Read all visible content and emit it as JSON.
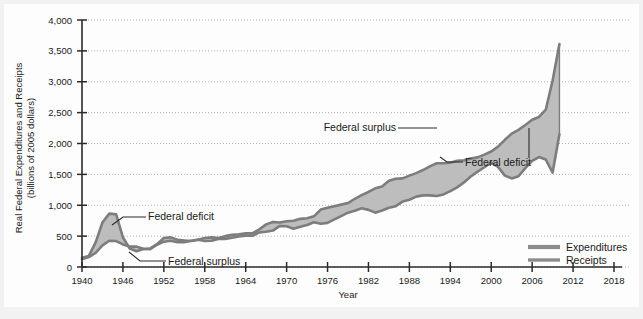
{
  "chart_data": {
    "type": "area",
    "title": "",
    "xlabel": "Year",
    "ylabel": "Real Federal Expenditures and Receipts (billions of 2005 dollars)",
    "ylabel_line1": "Real Federal Expenditures and Receipts",
    "ylabel_line2": "(billions of 2005 dollars)",
    "xlim": [
      1940,
      2018
    ],
    "ylim": [
      0,
      4000
    ],
    "grid": true,
    "legend_position": "bottom-right",
    "x_ticks": [
      "1940",
      "1946",
      "1952",
      "1958",
      "1964",
      "1970",
      "1976",
      "1982",
      "1988",
      "1994",
      "2000",
      "2006",
      "2012",
      "2018"
    ],
    "x_tick_values": [
      1940,
      1946,
      1952,
      1958,
      1964,
      1970,
      1976,
      1982,
      1988,
      1994,
      2000,
      2006,
      2012,
      2018
    ],
    "y_ticks": [
      "0",
      "500",
      "1,000",
      "1,500",
      "2,000",
      "2,500",
      "3,000",
      "3,500",
      "4,000"
    ],
    "y_tick_values": [
      0,
      500,
      1000,
      1500,
      2000,
      2500,
      3000,
      3500,
      4000
    ],
    "x": [
      1940,
      1941,
      1942,
      1943,
      1944,
      1945,
      1946,
      1947,
      1948,
      1949,
      1950,
      1951,
      1952,
      1953,
      1954,
      1955,
      1956,
      1957,
      1958,
      1959,
      1960,
      1961,
      1962,
      1963,
      1964,
      1965,
      1966,
      1967,
      1968,
      1969,
      1970,
      1971,
      1972,
      1973,
      1974,
      1975,
      1976,
      1977,
      1978,
      1979,
      1980,
      1981,
      1982,
      1983,
      1984,
      1985,
      1986,
      1987,
      1988,
      1989,
      1990,
      1991,
      1992,
      1993,
      1994,
      1995,
      1996,
      1997,
      1998,
      1999,
      2000,
      2001,
      2002,
      2003,
      2004,
      2005,
      2006,
      2007,
      2008,
      2009,
      2010
    ],
    "series": [
      {
        "name": "Expenditures",
        "color": "#8c8c8c",
        "values": [
          150,
          180,
          400,
          720,
          865,
          855,
          480,
          300,
          255,
          290,
          300,
          370,
          470,
          480,
          440,
          430,
          420,
          440,
          470,
          480,
          470,
          500,
          520,
          530,
          545,
          545,
          610,
          690,
          730,
          720,
          740,
          750,
          780,
          790,
          820,
          930,
          960,
          985,
          1010,
          1035,
          1105,
          1165,
          1215,
          1275,
          1305,
          1395,
          1430,
          1435,
          1480,
          1520,
          1570,
          1630,
          1680,
          1680,
          1690,
          1720,
          1730,
          1755,
          1775,
          1820,
          1870,
          1950,
          2060,
          2160,
          2220,
          2300,
          2385,
          2430,
          2550,
          3020,
          3610
        ]
      },
      {
        "name": "Receipts",
        "color": "#8c8c8c",
        "values": [
          125,
          160,
          230,
          350,
          425,
          420,
          365,
          330,
          330,
          295,
          290,
          360,
          410,
          425,
          400,
          400,
          425,
          440,
          420,
          425,
          455,
          455,
          475,
          495,
          505,
          505,
          560,
          570,
          590,
          665,
          660,
          620,
          650,
          680,
          725,
          700,
          715,
          770,
          825,
          880,
          910,
          950,
          925,
          880,
          915,
          960,
          985,
          1060,
          1090,
          1140,
          1160,
          1160,
          1150,
          1175,
          1230,
          1290,
          1370,
          1465,
          1545,
          1615,
          1690,
          1620,
          1480,
          1435,
          1470,
          1600,
          1720,
          1780,
          1740,
          1530,
          2150
        ]
      }
    ],
    "annotations": [
      {
        "id": "federal-deficit-left",
        "text": "Federal deficit",
        "label_x": 148,
        "label_y": 220,
        "leader": [
          [
            146,
            217
          ],
          [
            123,
            217
          ],
          [
            112,
            225
          ]
        ]
      },
      {
        "id": "federal-surplus-left",
        "text": "Federal surplus",
        "label_x": 168,
        "label_y": 265,
        "leader": [
          [
            166,
            261
          ],
          [
            140,
            261
          ],
          [
            129,
            252
          ]
        ]
      },
      {
        "id": "federal-surplus-right",
        "text": "Federal surplus",
        "label_x": 396,
        "label_y": 131,
        "leader": [
          [
            398,
            128
          ],
          [
            437,
            128
          ]
        ]
      },
      {
        "id": "federal-deficit-right",
        "text": "Federal deficit",
        "label_x": 465,
        "label_y": 166,
        "leader": [
          [
            463,
            162
          ],
          [
            447,
            162
          ],
          [
            440,
            157
          ]
        ]
      }
    ],
    "legend": [
      {
        "label": "Expenditures",
        "color": "#8c8c8c"
      },
      {
        "label": "Receipts",
        "color": "#8c8c8c"
      }
    ],
    "colors": {
      "band_fill": "#b9b9b9",
      "line": "#7d7d7d",
      "axis": "#2b2b2b",
      "grid": "#b0b0b0",
      "text": "#1a1a1a",
      "page_background": "#f2f2f2",
      "plot_background": "#fdfdfd"
    }
  }
}
